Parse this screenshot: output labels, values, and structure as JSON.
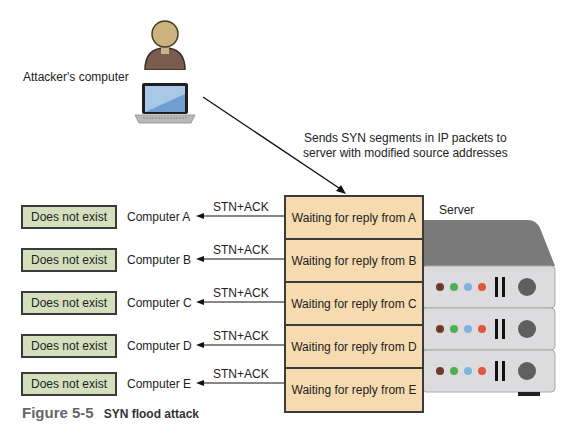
{
  "attacker": {
    "label": "Attacker's computer"
  },
  "annotation": {
    "line1": "Sends SYN segments in IP packets to",
    "line2": "server with modified source addresses"
  },
  "server": {
    "label": "Server",
    "led_colors": [
      "#6b3a2a",
      "#4caf50",
      "#7fb3e0",
      "#e0553f"
    ]
  },
  "rows": [
    {
      "status": "Does not exist",
      "computer": "Computer A",
      "reply": "STN+ACK",
      "waiting": "Waiting for reply from A"
    },
    {
      "status": "Does not exist",
      "computer": "Computer B",
      "reply": "STN+ACK",
      "waiting": "Waiting for reply from B"
    },
    {
      "status": "Does not exist",
      "computer": "Computer C",
      "reply": "STN+ACK",
      "waiting": "Waiting for reply from C"
    },
    {
      "status": "Does not exist",
      "computer": "Computer D",
      "reply": "STN+ACK",
      "waiting": "Waiting for reply from D"
    },
    {
      "status": "Does not exist",
      "computer": "Computer E",
      "reply": "STN+ACK",
      "waiting": "Waiting for reply from E"
    }
  ],
  "caption": {
    "number": "Figure 5-5",
    "title": "SYN flood attack"
  },
  "colors": {
    "dne_fill": "#d4e0bd",
    "wait_fill": "#f6dbb0",
    "server_gray": "#7a7a7a",
    "server_panel": "#dcdcde"
  }
}
